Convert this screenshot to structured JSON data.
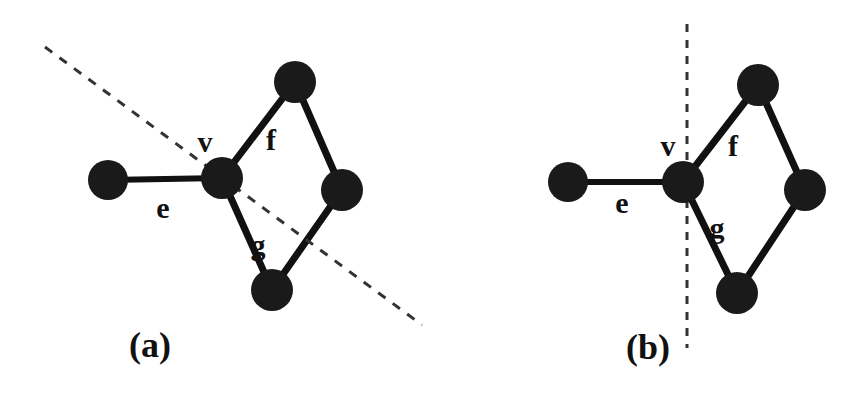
{
  "figure": {
    "background_color": "#ffffff",
    "ink_color": "#111111",
    "node_color": "#1a1a1a",
    "edge_color": "#111111",
    "dashed_color": "#333333",
    "width": 861,
    "height": 404
  },
  "panels": [
    {
      "id": "a",
      "caption": "(a)",
      "caption_x": 150,
      "caption_y": 357,
      "cut_line": {
        "style": "dashed",
        "orientation": "oblique",
        "x1": 45,
        "y1": 47,
        "x2": 422,
        "y2": 325,
        "dash_pattern": "9 9",
        "stroke_width": 3
      },
      "nodes": [
        {
          "id": "a-n1",
          "name": "left-endpoint",
          "cx": 108,
          "cy": 180,
          "r": 20
        },
        {
          "id": "a-v",
          "name": "vertex-v",
          "cx": 222,
          "cy": 178,
          "r": 21
        },
        {
          "id": "a-n3",
          "name": "top-node",
          "cx": 295,
          "cy": 82,
          "r": 21
        },
        {
          "id": "a-n4",
          "name": "right-node",
          "cx": 342,
          "cy": 190,
          "r": 21
        },
        {
          "id": "a-n5",
          "name": "bottom-node",
          "cx": 272,
          "cy": 290,
          "r": 21
        }
      ],
      "edges": [
        {
          "id": "a-e",
          "label": "e",
          "from": "a-n1",
          "to": "a-v",
          "x1": 108,
          "y1": 180,
          "x2": 222,
          "y2": 178,
          "stroke_width": 6
        },
        {
          "id": "a-f",
          "label": "f",
          "from": "a-v",
          "to": "a-n3",
          "x1": 222,
          "y1": 178,
          "x2": 295,
          "y2": 82,
          "stroke_width": 7
        },
        {
          "id": "a-g",
          "label": "g",
          "from": "a-v",
          "to": "a-n5",
          "x1": 222,
          "y1": 178,
          "x2": 272,
          "y2": 290,
          "stroke_width": 7
        },
        {
          "id": "a-h",
          "label": "",
          "from": "a-n3",
          "to": "a-n4",
          "x1": 295,
          "y1": 82,
          "x2": 342,
          "y2": 190,
          "stroke_width": 7
        },
        {
          "id": "a-i",
          "label": "",
          "from": "a-n4",
          "to": "a-n5",
          "x1": 342,
          "y1": 190,
          "x2": 272,
          "y2": 290,
          "stroke_width": 7
        }
      ],
      "labels": [
        {
          "id": "a-lab-v",
          "text": "v",
          "x": 205,
          "y": 152,
          "anchor": "middle"
        },
        {
          "id": "a-lab-e",
          "text": "e",
          "x": 163,
          "y": 218,
          "anchor": "middle"
        },
        {
          "id": "a-lab-f",
          "text": "f",
          "x": 271,
          "y": 150,
          "anchor": "middle"
        },
        {
          "id": "a-lab-g",
          "text": "g",
          "x": 258,
          "y": 255,
          "anchor": "middle"
        }
      ]
    },
    {
      "id": "b",
      "caption": "(b)",
      "caption_x": 648,
      "caption_y": 359,
      "cut_line": {
        "style": "dashed",
        "orientation": "vertical",
        "x1": 687,
        "y1": 24,
        "x2": 687,
        "y2": 348,
        "dash_pattern": "8 8",
        "stroke_width": 3
      },
      "nodes": [
        {
          "id": "b-n1",
          "name": "left-endpoint",
          "cx": 568,
          "cy": 182,
          "r": 20
        },
        {
          "id": "b-v",
          "name": "vertex-v",
          "cx": 683,
          "cy": 182,
          "r": 21
        },
        {
          "id": "b-n3",
          "name": "top-node",
          "cx": 758,
          "cy": 85,
          "r": 21
        },
        {
          "id": "b-n4",
          "name": "right-node",
          "cx": 805,
          "cy": 190,
          "r": 21
        },
        {
          "id": "b-n5",
          "name": "bottom-node",
          "cx": 737,
          "cy": 293,
          "r": 21
        }
      ],
      "edges": [
        {
          "id": "b-e",
          "label": "e",
          "from": "b-n1",
          "to": "b-v",
          "x1": 568,
          "y1": 182,
          "x2": 683,
          "y2": 182,
          "stroke_width": 6
        },
        {
          "id": "b-f",
          "label": "f",
          "from": "b-v",
          "to": "b-n3",
          "x1": 683,
          "y1": 182,
          "x2": 758,
          "y2": 85,
          "stroke_width": 7
        },
        {
          "id": "b-g",
          "label": "g",
          "from": "b-v",
          "to": "b-n5",
          "x1": 683,
          "y1": 182,
          "x2": 737,
          "y2": 293,
          "stroke_width": 7
        },
        {
          "id": "b-h",
          "label": "",
          "from": "b-n3",
          "to": "b-n4",
          "x1": 758,
          "y1": 85,
          "x2": 805,
          "y2": 190,
          "stroke_width": 7
        },
        {
          "id": "b-i",
          "label": "",
          "from": "b-n4",
          "to": "b-n5",
          "x1": 805,
          "y1": 190,
          "x2": 737,
          "y2": 293,
          "stroke_width": 7
        }
      ],
      "labels": [
        {
          "id": "b-lab-v",
          "text": "v",
          "x": 668,
          "y": 156,
          "anchor": "middle"
        },
        {
          "id": "b-lab-e",
          "text": "e",
          "x": 622,
          "y": 213,
          "anchor": "middle"
        },
        {
          "id": "b-lab-f",
          "text": "f",
          "x": 733,
          "y": 156,
          "anchor": "middle"
        },
        {
          "id": "b-lab-g",
          "text": "g",
          "x": 717,
          "y": 238,
          "anchor": "middle"
        }
      ]
    }
  ]
}
